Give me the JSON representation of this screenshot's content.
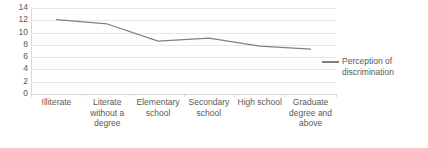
{
  "chart_data": {
    "type": "line",
    "title": "",
    "xlabel": "",
    "ylabel": "",
    "categories": [
      "Illiterate",
      "Literate without a degree",
      "Elementary school",
      "Secondary school",
      "High school",
      "Graduate degree and above"
    ],
    "series": [
      {
        "name": "Perception of discrimination",
        "values": [
          12.1,
          11.4,
          8.6,
          9.1,
          7.8,
          7.3
        ],
        "color": "#808080"
      }
    ],
    "ylim": [
      0,
      14
    ],
    "ytick_labels": [
      "14",
      "12",
      "10",
      "8",
      "6",
      "4",
      "2",
      "0"
    ],
    "ytick_values": [
      14,
      12,
      10,
      8,
      6,
      4,
      2,
      0
    ],
    "grid": true,
    "legend_position": "right",
    "legend_entries": [
      "Perception of discrimination"
    ]
  },
  "legend": {
    "label": "Perception of discrimination",
    "marker": "line-marker"
  }
}
